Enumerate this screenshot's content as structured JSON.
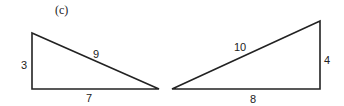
{
  "figure": {
    "caption": "(c)",
    "triangles": [
      {
        "name": "left-triangle",
        "sides": {
          "vertical": "3",
          "horizontal": "7",
          "hypotenuse": "9"
        }
      },
      {
        "name": "right-triangle",
        "sides": {
          "vertical": "4",
          "horizontal": "8",
          "hypotenuse": "10"
        }
      }
    ],
    "stroke_color": "#222222"
  }
}
